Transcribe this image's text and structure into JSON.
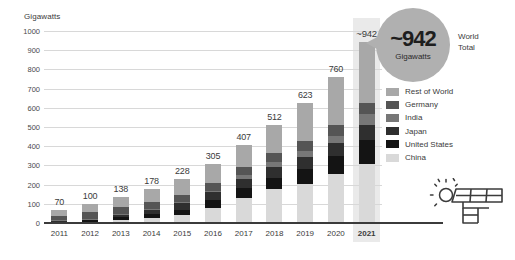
{
  "chart_data": {
    "type": "bar",
    "title": "",
    "subtitle": "",
    "xlabel": "",
    "ylabel": "Gigawatts",
    "ylim": [
      0,
      1000
    ],
    "ytick_step": 100,
    "yticks": [
      "1000",
      "900",
      "800",
      "700",
      "600",
      "500",
      "400",
      "300",
      "200",
      "100",
      "0"
    ],
    "grid": true,
    "stacked": true,
    "legend_position": "right",
    "categories": [
      "2011",
      "2012",
      "2013",
      "2014",
      "2015",
      "2016",
      "2017",
      "2018",
      "2019",
      "2020",
      "2021"
    ],
    "highlight_category": "2021",
    "totals": [
      70,
      100,
      138,
      178,
      228,
      305,
      407,
      512,
      623,
      760,
      942
    ],
    "total_labels": [
      "70",
      "100",
      "138",
      "178",
      "228",
      "305",
      "407",
      "512",
      "623",
      "760",
      "~942"
    ],
    "series": [
      {
        "name": "China",
        "color": "#d9d9d9",
        "values": [
          3,
          7,
          18,
          28,
          43,
          77,
          130,
          175,
          205,
          254,
          307
        ]
      },
      {
        "name": "United States",
        "color": "#141414",
        "values": [
          5,
          8,
          13,
          19,
          26,
          41,
          52,
          62,
          76,
          94,
          123
        ]
      },
      {
        "name": "Japan",
        "color": "#2f2f2f",
        "values": [
          5,
          7,
          14,
          23,
          34,
          42,
          49,
          56,
          62,
          68,
          78
        ]
      },
      {
        "name": "India",
        "color": "#777777",
        "values": [
          1,
          1,
          2,
          3,
          5,
          9,
          18,
          26,
          34,
          39,
          60
        ]
      },
      {
        "name": "Germany",
        "color": "#555555",
        "values": [
          25,
          33,
          36,
          38,
          40,
          41,
          42,
          45,
          49,
          54,
          59
        ]
      },
      {
        "name": "Rest of World",
        "color": "#a8a8a8",
        "values": [
          31,
          44,
          55,
          67,
          80,
          95,
          116,
          148,
          197,
          251,
          315
        ]
      }
    ],
    "annotations": [
      {
        "name": "world-total-callout",
        "value": "~942",
        "unit": "Gigawatts",
        "caption_line_1": "World",
        "caption_line_2": "Total",
        "attached_to": "2021"
      }
    ],
    "colors": {
      "gridline": "#d8d8d8",
      "axis": "#3b3b3b",
      "highlight_band": "#eaeaea",
      "callout_bubble": "#b0b0b0",
      "text": "#3b3b3b"
    }
  },
  "legend": {
    "items": [
      {
        "label": "Rest of World",
        "color": "#a8a8a8"
      },
      {
        "label": "Germany",
        "color": "#555555"
      },
      {
        "label": "India",
        "color": "#777777"
      },
      {
        "label": "Japan",
        "color": "#2f2f2f"
      },
      {
        "label": "United States",
        "color": "#141414"
      },
      {
        "label": "China",
        "color": "#d9d9d9"
      }
    ]
  },
  "axis": {
    "y_title": "Gigawatts"
  },
  "callout": {
    "value": "~942",
    "unit": "Gigawatts",
    "caption_line_1": "World",
    "caption_line_2": "Total"
  },
  "icons": {
    "solar": "solar-panel-sun-icon"
  }
}
